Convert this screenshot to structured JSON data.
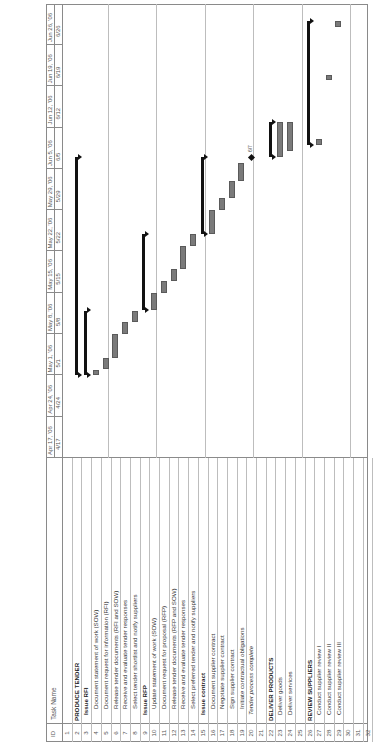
{
  "header": {
    "id_label": "ID",
    "task_name_label": "Task Name",
    "weeks": [
      {
        "major": "Apr 17, '06",
        "minor": "4/17"
      },
      {
        "major": "Apr 24, '06",
        "minor": "4/24"
      },
      {
        "major": "May 1, '06",
        "minor": "5/1"
      },
      {
        "major": "May 8, '06",
        "minor": "5/8"
      },
      {
        "major": "May 15, '06",
        "minor": "5/15"
      },
      {
        "major": "May 22, '06",
        "minor": "5/22"
      },
      {
        "major": "May 29, '06",
        "minor": "5/29"
      },
      {
        "major": "Jun 5, '06",
        "minor": "6/5"
      },
      {
        "major": "Jun 12, '06",
        "minor": "6/12"
      },
      {
        "major": "Jun 19, '06",
        "minor": "6/19"
      },
      {
        "major": "Jun 26, '06",
        "minor": "6/26"
      }
    ]
  },
  "tasks": [
    {
      "id": "1",
      "name": "",
      "style": "normal"
    },
    {
      "id": "2",
      "name": "PRODUCE TENDER",
      "style": "phase"
    },
    {
      "id": "3",
      "name": "Issue RFI",
      "style": "group"
    },
    {
      "id": "4",
      "name": "Document statement of work (SOW)",
      "style": "task"
    },
    {
      "id": "5",
      "name": "Document request for information (RFI)",
      "style": "task"
    },
    {
      "id": "6",
      "name": "Release tender documents (RFI and SOW)",
      "style": "task"
    },
    {
      "id": "7",
      "name": "Receive and evaluate tender responses",
      "style": "task"
    },
    {
      "id": "8",
      "name": "Select tender shortlist and notify suppliers",
      "style": "task"
    },
    {
      "id": "9",
      "name": "Issue RFP",
      "style": "group"
    },
    {
      "id": "10",
      "name": "Update statement of work (SOW)",
      "style": "task"
    },
    {
      "id": "11",
      "name": "Document request for proposal (RFP)",
      "style": "task"
    },
    {
      "id": "12",
      "name": "Release tender documents (RFP and SOW)",
      "style": "task"
    },
    {
      "id": "13",
      "name": "Receive and evaluate tender responses",
      "style": "task"
    },
    {
      "id": "14",
      "name": "Select preferred tender and notify suppliers",
      "style": "task"
    },
    {
      "id": "15",
      "name": "Issue contract",
      "style": "group"
    },
    {
      "id": "16",
      "name": "Document supplier contract",
      "style": "task"
    },
    {
      "id": "17",
      "name": "Negotiate supplier contract",
      "style": "task"
    },
    {
      "id": "18",
      "name": "Sign supplier contract",
      "style": "task"
    },
    {
      "id": "19",
      "name": "Initiate contractual obligations",
      "style": "task"
    },
    {
      "id": "20",
      "name": "Tender process complete",
      "style": "milestone"
    },
    {
      "id": "21",
      "name": "",
      "style": "normal"
    },
    {
      "id": "22",
      "name": "DELIVER PRODUCTS",
      "style": "phase"
    },
    {
      "id": "23",
      "name": "Deliver goods",
      "style": "subtask"
    },
    {
      "id": "24",
      "name": "Deliver services",
      "style": "subtask"
    },
    {
      "id": "25",
      "name": "",
      "style": "normal"
    },
    {
      "id": "26",
      "name": "REVIEW SUPPLIERS",
      "style": "phase"
    },
    {
      "id": "27",
      "name": "Conduct supplier review I",
      "style": "subtask"
    },
    {
      "id": "28",
      "name": "Conduct supplier review II",
      "style": "subtask"
    },
    {
      "id": "29",
      "name": "Conduct supplier review III",
      "style": "subtask"
    },
    {
      "id": "30",
      "name": "",
      "style": "normal"
    },
    {
      "id": "31",
      "name": "",
      "style": "normal"
    },
    {
      "id": "32",
      "name": "",
      "style": "normal"
    }
  ],
  "milestone_label": "6/7",
  "colors": {
    "task_bar": "#7a7a7a",
    "summary_bar": "#111111",
    "gridline": "#bdbdbd",
    "border": "#8a8a8a"
  },
  "chart_data": {
    "type": "gantt",
    "timescale_start": "2006-04-17",
    "timescale_end": "2006-07-02",
    "bars": [
      {
        "id": 2,
        "kind": "summary",
        "start": "2006-05-01",
        "end": "2006-06-07"
      },
      {
        "id": 3,
        "kind": "summary",
        "start": "2006-05-01",
        "end": "2006-05-12"
      },
      {
        "id": 4,
        "kind": "task",
        "start": "2006-05-01",
        "end": "2006-05-02"
      },
      {
        "id": 5,
        "kind": "task",
        "start": "2006-05-02",
        "end": "2006-05-04"
      },
      {
        "id": 6,
        "kind": "task",
        "start": "2006-05-04",
        "end": "2006-05-08"
      },
      {
        "id": 7,
        "kind": "task",
        "start": "2006-05-08",
        "end": "2006-05-10"
      },
      {
        "id": 8,
        "kind": "task",
        "start": "2006-05-10",
        "end": "2006-05-12"
      },
      {
        "id": 9,
        "kind": "summary",
        "start": "2006-05-12",
        "end": "2006-05-25"
      },
      {
        "id": 10,
        "kind": "task",
        "start": "2006-05-12",
        "end": "2006-05-15"
      },
      {
        "id": 11,
        "kind": "task",
        "start": "2006-05-15",
        "end": "2006-05-17"
      },
      {
        "id": 12,
        "kind": "task",
        "start": "2006-05-17",
        "end": "2006-05-19"
      },
      {
        "id": 13,
        "kind": "task",
        "start": "2006-05-19",
        "end": "2006-05-23"
      },
      {
        "id": 14,
        "kind": "task",
        "start": "2006-05-23",
        "end": "2006-05-25"
      },
      {
        "id": 15,
        "kind": "summary",
        "start": "2006-05-25",
        "end": "2006-06-07"
      },
      {
        "id": 16,
        "kind": "task",
        "start": "2006-05-25",
        "end": "2006-05-29"
      },
      {
        "id": 17,
        "kind": "task",
        "start": "2006-05-29",
        "end": "2006-05-31"
      },
      {
        "id": 18,
        "kind": "task",
        "start": "2006-05-31",
        "end": "2006-06-03"
      },
      {
        "id": 19,
        "kind": "task",
        "start": "2006-06-03",
        "end": "2006-06-06"
      },
      {
        "id": 20,
        "kind": "milestone",
        "date": "2006-06-07",
        "label": "6/7"
      },
      {
        "id": 22,
        "kind": "summary",
        "start": "2006-06-07",
        "end": "2006-06-13"
      },
      {
        "id": 23,
        "kind": "task",
        "start": "2006-06-07",
        "end": "2006-06-13"
      },
      {
        "id": 24,
        "kind": "task",
        "start": "2006-06-08",
        "end": "2006-06-13"
      },
      {
        "id": 26,
        "kind": "summary",
        "start": "2006-06-09",
        "end": "2006-06-30"
      },
      {
        "id": 27,
        "kind": "task",
        "start": "2006-06-09",
        "end": "2006-06-10"
      },
      {
        "id": 28,
        "kind": "task",
        "start": "2006-06-20",
        "end": "2006-06-21"
      },
      {
        "id": 29,
        "kind": "task",
        "start": "2006-06-29",
        "end": "2006-06-30"
      }
    ]
  }
}
